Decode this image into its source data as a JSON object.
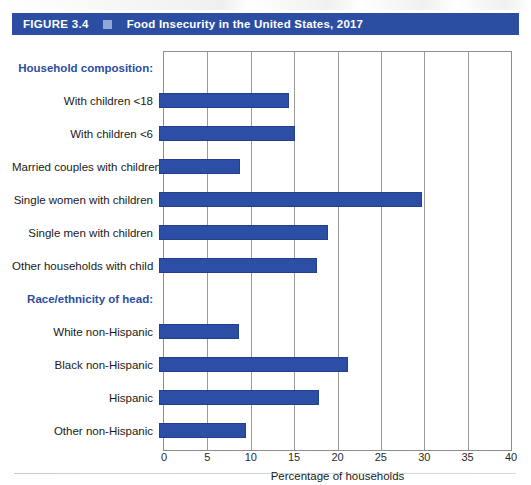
{
  "figure": {
    "number": "FIGURE 3.4",
    "marker": "square-marker",
    "title": "Food Insecurity in the United States, 2017"
  },
  "chart_data": {
    "type": "bar",
    "orientation": "horizontal",
    "title": "Food Insecurity in the United States, 2017",
    "xlabel": "Percentage of households",
    "ylabel": "",
    "xlim": [
      0,
      40
    ],
    "xticks": [
      0,
      5,
      10,
      15,
      20,
      25,
      30,
      35,
      40
    ],
    "grid": "vertical",
    "legend": "none",
    "bar_color": "#2c4fa5",
    "group_label_color": "#2b4ea2",
    "groups": [
      {
        "label": "Household composition:",
        "categories": [
          "With children <18",
          "With children <6",
          "Married couples with children",
          "Single women with children",
          "Single men with children",
          "Other households with child"
        ],
        "values": [
          15.0,
          15.7,
          9.3,
          30.3,
          19.5,
          18.2
        ]
      },
      {
        "label": "Race/ethnicity of head:",
        "categories": [
          "White non-Hispanic",
          "Black non-Hispanic",
          "Hispanic",
          "Other non-Hispanic"
        ],
        "values": [
          9.2,
          21.8,
          18.4,
          10.0
        ]
      }
    ]
  },
  "axis": {
    "ticks": [
      "0",
      "5",
      "10",
      "15",
      "20",
      "25",
      "30",
      "35",
      "40"
    ],
    "title": "Percentage of households"
  },
  "rows": [
    {
      "label": "Household composition:",
      "kind": "group",
      "value": null
    },
    {
      "label": "With children <18",
      "kind": "bar",
      "value": 15.0
    },
    {
      "label": "With children <6",
      "kind": "bar",
      "value": 15.7
    },
    {
      "label": "Married couples with children",
      "kind": "bar",
      "value": 9.3
    },
    {
      "label": "Single women with children",
      "kind": "bar",
      "value": 30.3
    },
    {
      "label": "Single men with children",
      "kind": "bar",
      "value": 19.5
    },
    {
      "label": "Other households with child",
      "kind": "bar",
      "value": 18.2
    },
    {
      "label": "Race/ethnicity of head:",
      "kind": "group",
      "value": null
    },
    {
      "label": "White non-Hispanic",
      "kind": "bar",
      "value": 9.2
    },
    {
      "label": "Black non-Hispanic",
      "kind": "bar",
      "value": 21.8
    },
    {
      "label": "Hispanic",
      "kind": "bar",
      "value": 18.4
    },
    {
      "label": "Other non-Hispanic",
      "kind": "bar",
      "value": 10.0
    }
  ]
}
